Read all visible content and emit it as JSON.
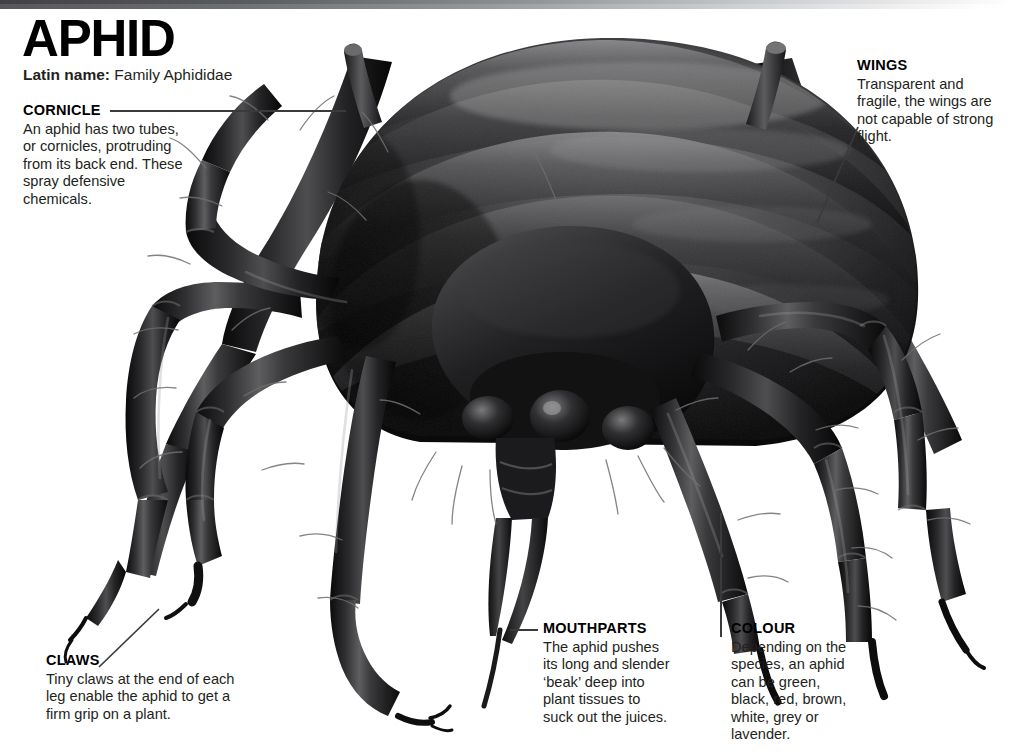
{
  "page": {
    "title": "APHID",
    "latin_label": "Latin name:",
    "latin_value": "Family Aphididae",
    "background": "#ffffff",
    "text_color": "#231f20",
    "rule_color": "#3a3a3c"
  },
  "callouts": {
    "cornicle": {
      "heading": "CORNICLE",
      "body": "An aphid has two tubes, or cornicles, protruding from its back end. These spray defensive chemicals."
    },
    "wings": {
      "heading": "WINGS",
      "body": "Transparent and fragile, the wings are not capable of strong flight."
    },
    "claws": {
      "heading": "CLAWS",
      "body": "Tiny claws at the end of each leg enable the aphid to get a firm grip on a plant."
    },
    "mouthparts": {
      "heading": "MOUTHPARTS",
      "body": "The aphid pushes its long and slender ‘beak’ deep into plant tissues to suck out the juices."
    },
    "colour": {
      "heading": "COLOUR",
      "body": "Depending on the species, an aphid can be green, black, red, brown, white, grey or lavender."
    }
  },
  "illustration": {
    "subject": "aphid-macro-photograph",
    "description": "Black-and-white macro image of an aphid seen from the front, showing segmented abdomen, six jointed legs with claws, two cornicles and a downward-pointing beak."
  }
}
